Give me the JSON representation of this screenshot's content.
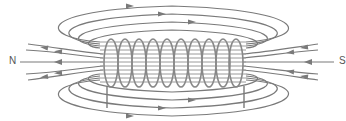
{
  "diagram": {
    "type": "solenoid-magnetic-field",
    "labels": {
      "north": "N",
      "south": "S"
    },
    "colors": {
      "line": "#7a7a7a",
      "coil": "#888888",
      "label": "#555555",
      "background": "#ffffff"
    },
    "coil": {
      "turns": 10,
      "x_start": 103,
      "x_end": 243,
      "y_top": 38,
      "y_bottom": 88
    },
    "field_lines": {
      "outer_loops_top": 4,
      "outer_loops_bottom": 4,
      "external_lines_each_side": 5,
      "direction_outside": "left-to-right (from N side around to S side)",
      "direction_at_poles": "arrows point toward N on left, toward coil from S on right"
    }
  }
}
